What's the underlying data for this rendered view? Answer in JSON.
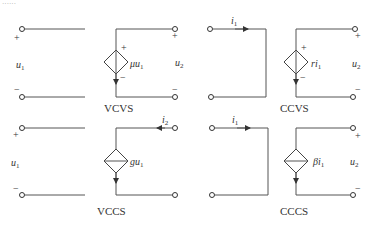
{
  "header_fragment": "······",
  "circuits": [
    {
      "name": "VCVS",
      "caption": "VCVS",
      "input": {
        "label": "u",
        "sub": "1",
        "plus": "+",
        "minus": "−"
      },
      "source": {
        "type": "voltage",
        "coef": "μ",
        "var": "u",
        "sub": "1",
        "plus": "+",
        "minus": "−"
      },
      "output": {
        "label": "u",
        "sub": "2",
        "plus": "+",
        "minus": "−"
      }
    },
    {
      "name": "CCVS",
      "caption": "CCVS",
      "input": {
        "current": "i",
        "sub": "1"
      },
      "source": {
        "type": "voltage",
        "coef": "r",
        "var": "i",
        "sub": "1",
        "plus": "+",
        "minus": "−"
      },
      "output": {
        "label": "u",
        "sub": "2",
        "plus": "+",
        "minus": "−"
      }
    },
    {
      "name": "VCCS",
      "caption": "VCCS",
      "input": {
        "label": "u",
        "sub": "1",
        "plus": "+",
        "minus": "−"
      },
      "source": {
        "type": "current",
        "coef": "g",
        "var": "u",
        "sub": "1"
      },
      "output": {
        "current": "i",
        "sub": "2"
      }
    },
    {
      "name": "CCCS",
      "caption": "CCCS",
      "input": {
        "current": "i",
        "sub": "1"
      },
      "source": {
        "type": "current",
        "coef": "β",
        "var": "i",
        "sub": "1"
      },
      "output": {
        "label": "u",
        "sub": "2",
        "plus": "+",
        "minus": "−"
      }
    }
  ]
}
